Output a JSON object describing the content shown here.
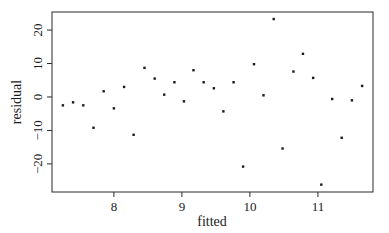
{
  "chart_data": {
    "type": "scatter",
    "title": "",
    "xlabel": "fitted",
    "ylabel": "residual",
    "xlim": [
      7.09,
      11.81
    ],
    "ylim": [
      -28.4,
      25.4
    ],
    "xticks": [
      8,
      9,
      10,
      11
    ],
    "yticks": [
      -20,
      -10,
      0,
      10,
      20
    ],
    "xtick_labels": [
      "8",
      "9",
      "10",
      "11"
    ],
    "ytick_labels": [
      "−20",
      "−10",
      "0",
      "10",
      "20"
    ],
    "grid": false,
    "legend": null,
    "series": [
      {
        "name": "residuals",
        "marker": "dot",
        "color": "#1a1a1a",
        "points": [
          {
            "x": 7.25,
            "y": -2.5
          },
          {
            "x": 7.4,
            "y": -1.6
          },
          {
            "x": 7.55,
            "y": -2.5
          },
          {
            "x": 7.7,
            "y": -9.2
          },
          {
            "x": 7.85,
            "y": 1.7
          },
          {
            "x": 8.0,
            "y": -3.4
          },
          {
            "x": 8.15,
            "y": 3.0
          },
          {
            "x": 8.29,
            "y": -11.3
          },
          {
            "x": 8.45,
            "y": 8.7
          },
          {
            "x": 8.6,
            "y": 5.5
          },
          {
            "x": 8.74,
            "y": 0.7
          },
          {
            "x": 8.89,
            "y": 4.4
          },
          {
            "x": 9.03,
            "y": -1.3
          },
          {
            "x": 9.17,
            "y": 8.0
          },
          {
            "x": 9.32,
            "y": 4.4
          },
          {
            "x": 9.47,
            "y": 2.6
          },
          {
            "x": 9.61,
            "y": -4.3
          },
          {
            "x": 9.76,
            "y": 4.4
          },
          {
            "x": 9.9,
            "y": -20.8
          },
          {
            "x": 10.06,
            "y": 9.8
          },
          {
            "x": 10.2,
            "y": 0.5
          },
          {
            "x": 10.35,
            "y": 23.3
          },
          {
            "x": 10.48,
            "y": -15.4
          },
          {
            "x": 10.64,
            "y": 7.6
          },
          {
            "x": 10.78,
            "y": 12.9
          },
          {
            "x": 10.93,
            "y": 5.7
          },
          {
            "x": 11.05,
            "y": -26.2
          },
          {
            "x": 11.21,
            "y": -0.6
          },
          {
            "x": 11.35,
            "y": -12.2
          },
          {
            "x": 11.5,
            "y": -1.0
          },
          {
            "x": 11.65,
            "y": 3.3
          }
        ]
      }
    ]
  },
  "layout": {
    "plot_left": 52,
    "plot_top": 12,
    "plot_right": 373,
    "plot_bottom": 192
  }
}
